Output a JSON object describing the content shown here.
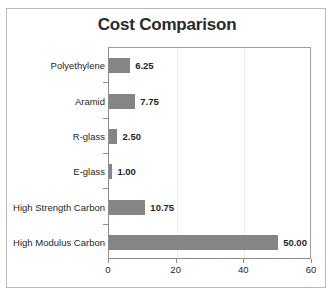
{
  "chart_data": {
    "type": "bar",
    "orientation": "horizontal",
    "title": "Cost Comparison",
    "xlabel": "",
    "ylabel": "",
    "categories": [
      "Polyethylene",
      "Aramid",
      "R-glass",
      "E-glass",
      "High Strength Carbon",
      "High Modulus Carbon"
    ],
    "values": [
      6.25,
      7.75,
      2.5,
      1.0,
      10.75,
      50.0
    ],
    "data_labels": [
      "6.25",
      "7.75",
      "2.50",
      "1.00",
      "10.75",
      "50.00"
    ],
    "xlim": [
      0,
      60
    ],
    "xticks": [
      0,
      20,
      40,
      60
    ],
    "xtick_labels": [
      "0",
      "20",
      "40",
      "60"
    ],
    "grid": true,
    "gridlines_at": [
      20,
      40
    ],
    "legend": false,
    "series": [
      {
        "name": "Cost",
        "values": [
          6.25,
          7.75,
          2.5,
          1.0,
          10.75,
          50.0
        ],
        "color": "#858585"
      }
    ]
  },
  "style": {
    "bar_color": "#858585",
    "frame_color": "#b9b9b9",
    "axis_color": "#8c8c8c",
    "grid_color": "#ededed",
    "title_color": "#2a2a2a",
    "label_color": "#262626",
    "background": "#ffffff"
  }
}
